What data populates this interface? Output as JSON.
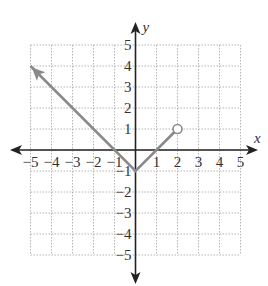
{
  "chart_data": {
    "type": "line",
    "title": "",
    "xlabel": "x",
    "ylabel": "y",
    "xlim": [
      -5,
      5
    ],
    "ylim": [
      -5,
      5
    ],
    "grid": true,
    "grid_style": "dotted",
    "x_ticks": [
      "-5",
      "-4",
      "-3",
      "-2",
      "-1",
      "1",
      "2",
      "3",
      "4",
      "5"
    ],
    "y_ticks": [
      "5",
      "4",
      "3",
      "2",
      "1",
      "-1",
      "-2",
      "-3",
      "-4",
      "-5"
    ],
    "series": [
      {
        "name": "f(x) = |x| - 1, x < 2",
        "points": [
          [
            -5,
            4
          ],
          [
            0,
            -1
          ],
          [
            2,
            1
          ]
        ],
        "start_marker": "arrow",
        "end_marker": "open-circle",
        "color": "#8a8a8a"
      }
    ],
    "axis_color": "#222222",
    "grid_color": "#b5b5b5"
  }
}
